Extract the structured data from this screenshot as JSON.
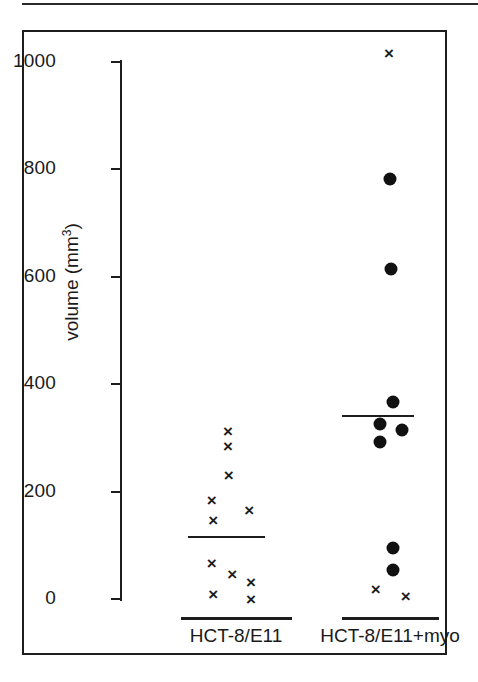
{
  "figure": {
    "frame_color": "#1d1d1d",
    "background": "#ffffff",
    "marker_color": "#111111"
  },
  "axis": {
    "y_title_text": "volume (mm",
    "y_title_sup": "3",
    "y_title_close": ")",
    "y_ticks": [
      "0",
      "200",
      "400",
      "600",
      "800",
      "1000"
    ]
  },
  "groups": [
    {
      "label": "HCT-8/E11"
    },
    {
      "label": "HCT-8/E11+myo"
    }
  ],
  "chart_data": {
    "type": "scatter",
    "title": "",
    "xlabel": "",
    "ylabel": "volume (mm3)",
    "ylim": [
      0,
      1040
    ],
    "yticks": [
      0,
      200,
      400,
      600,
      800,
      1000
    ],
    "grid": false,
    "legend": "none",
    "groups": [
      {
        "name": "HCT-8/E11",
        "marker": "x",
        "values": [
          313,
          285,
          231,
          184,
          166,
          147,
          67,
          47,
          32,
          9,
          0
        ],
        "jitter": [
          0.5,
          0.5,
          0.51,
          0.3,
          0.76,
          0.32,
          0.3,
          0.55,
          0.78,
          0.32,
          0.78
        ],
        "mean": 115
      },
      {
        "name": "HCT-8/E11+myo",
        "marker": "mixed",
        "points": [
          {
            "value": 1017,
            "marker": "x",
            "jitter": 0.5
          },
          {
            "value": 782,
            "marker": "dot",
            "jitter": 0.52
          },
          {
            "value": 614,
            "marker": "dot",
            "jitter": 0.53
          },
          {
            "value": 367,
            "marker": "dot",
            "jitter": 0.55
          },
          {
            "value": 326,
            "marker": "dot",
            "jitter": 0.37
          },
          {
            "value": 315,
            "marker": "dot",
            "jitter": 0.69
          },
          {
            "value": 292,
            "marker": "dot",
            "jitter": 0.37
          },
          {
            "value": 95,
            "marker": "dot",
            "jitter": 0.55
          },
          {
            "value": 54,
            "marker": "dot",
            "jitter": 0.55
          },
          {
            "value": 19,
            "marker": "x",
            "jitter": 0.31
          },
          {
            "value": 6,
            "marker": "x",
            "jitter": 0.74
          }
        ],
        "mean": 341
      }
    ]
  }
}
